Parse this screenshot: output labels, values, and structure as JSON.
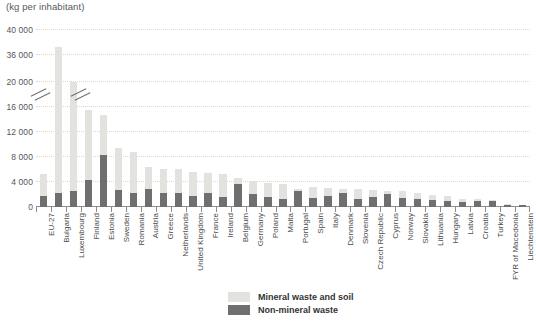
{
  "chart_data": {
    "type": "bar",
    "stacked": true,
    "title": "(kg per inhabitant)",
    "xlabel": "",
    "ylabel": "",
    "ylim": [
      0,
      40000
    ],
    "axis_break": true,
    "axis_break_between": [
      16000,
      20000
    ],
    "grid": true,
    "legend_position": "bottom-center",
    "ytick_labels": [
      "40 000",
      "36 000",
      "20 000",
      "16 000",
      "12 000",
      "8 000",
      "4 000",
      "0"
    ],
    "ytick_values": [
      40000,
      36000,
      20000,
      16000,
      12000,
      8000,
      4000,
      0
    ],
    "categories": [
      "EU-27",
      "Bulgaria",
      "Luxembourg",
      "Finland",
      "Estonia",
      "Sweden",
      "Romania",
      "Austria",
      "Greece",
      "Netherlands",
      "United Kingdom",
      "France",
      "Ireland",
      "Belgium",
      "Germany",
      "Poland",
      "Malta",
      "Portugal",
      "Spain",
      "Italy",
      "Denmark",
      "Slovenia",
      "Czech Republic",
      "Cyprus",
      "Norway",
      "Slovakia",
      "Lithuania",
      "Hungary",
      "Latvia",
      "Croatia",
      "Turkey",
      "FYR of Macedonia",
      "Liechtenstein"
    ],
    "series": [
      {
        "name": "Non-mineral waste",
        "color": "#6f6f6f",
        "values": [
          1700,
          2300,
          2550,
          4350,
          8250,
          2650,
          2300,
          2800,
          2200,
          2300,
          1750,
          2300,
          1600,
          3600,
          2100,
          1550,
          1350,
          2500,
          1500,
          1750,
          2300,
          1350,
          1550,
          2000,
          1400,
          1200,
          1150,
          900,
          750,
          900,
          1000,
          350,
          300
        ]
      },
      {
        "name": "Mineral waste and soil",
        "color": "#e2e2df",
        "values": [
          3500,
          35000,
          17300,
          11050,
          6400,
          6700,
          6400,
          3600,
          3900,
          3700,
          3900,
          3200,
          3600,
          1000,
          2000,
          2250,
          2300,
          350,
          1650,
          1250,
          600,
          1450,
          1150,
          600,
          1100,
          1000,
          750,
          850,
          500,
          350,
          150,
          120,
          100
        ]
      }
    ],
    "totals": [
      5200,
      37300,
      19850,
      15400,
      14650,
      9350,
      8700,
      6400,
      6100,
      6000,
      5650,
      5500,
      5200,
      4600,
      4100,
      3800,
      3650,
      2850,
      3150,
      3000,
      2900,
      2800,
      2700,
      2600,
      2500,
      2200,
      1900,
      1750,
      1250,
      1250,
      1150,
      470,
      400
    ]
  },
  "legend": {
    "items": [
      {
        "label": "Mineral waste and soil",
        "swatch": "mineral-swatch"
      },
      {
        "label": "Non-mineral waste",
        "swatch": "non-mineral-swatch"
      }
    ]
  }
}
